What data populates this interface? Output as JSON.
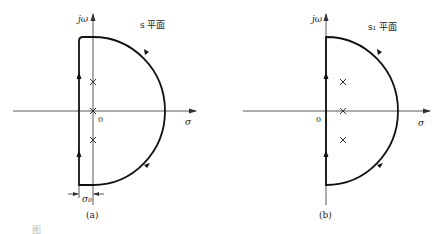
{
  "figure": {
    "panel_a": {
      "plane_label": "s 平面",
      "vertical_axis_label": "jω",
      "horizontal_axis_label": "σ",
      "origin_label": "0",
      "offset_label": "σ₀",
      "subcaption": "(a)",
      "poles_count": 3
    },
    "panel_b": {
      "plane_label": "s₁ 平面",
      "vertical_axis_label": "jω",
      "horizontal_axis_label": "σ",
      "origin_label": "0",
      "subcaption": "(b)",
      "poles_count": 3
    },
    "caption": "图"
  }
}
